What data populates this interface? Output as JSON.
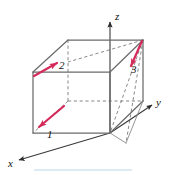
{
  "figure": {
    "background_color": "#ffffff",
    "width": 169,
    "height": 175,
    "axes": {
      "color": "#3a3a3a",
      "labels": {
        "z": "z",
        "y": "y",
        "x": "x"
      }
    },
    "cube": {
      "edge_color_solid": "#6b6b6b",
      "edge_color_hidden": "#7a7a7a",
      "hidden_edge_style": "dashed"
    },
    "vectors": {
      "color": "#d42b5a",
      "items": [
        {
          "id": "vector-1",
          "label": "1"
        },
        {
          "id": "vector-2",
          "label": "2"
        },
        {
          "id": "vector-3",
          "label": "3"
        }
      ]
    },
    "footer_rule": {
      "color": "#bcd8ea"
    }
  }
}
